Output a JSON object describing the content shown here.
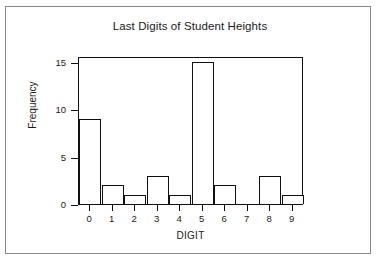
{
  "chart_data": {
    "type": "bar",
    "title": "Last Digits of Student Heights",
    "xlabel": "DIGIT",
    "ylabel": "Frequency",
    "categories": [
      "0",
      "1",
      "2",
      "3",
      "4",
      "5",
      "6",
      "7",
      "8",
      "9"
    ],
    "values": [
      9,
      2,
      1,
      3,
      1,
      15,
      2,
      0,
      3,
      1
    ],
    "ylim": [
      0,
      15.6
    ],
    "xlim": [
      -0.5,
      9.5
    ],
    "yticks": [
      0,
      5,
      10,
      15
    ],
    "ytick_labels": [
      "0",
      "5",
      "10",
      "15"
    ],
    "xtick_labels": [
      "0",
      "1",
      "2",
      "3",
      "4",
      "5",
      "6",
      "7",
      "8",
      "9"
    ],
    "grid": false,
    "legend": false,
    "bar_fill_color": "#ffffff",
    "bar_edge_color": "#101010",
    "axis_color": "#101010",
    "background_color": "#ffffff",
    "border_color": "#8a8a8a"
  }
}
